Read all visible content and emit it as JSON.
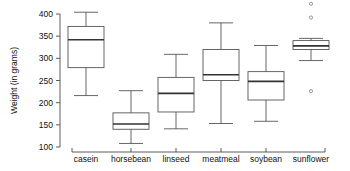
{
  "chart_data": {
    "type": "box",
    "title": "",
    "subtitle": "",
    "xlabel": "",
    "ylabel": "Weight (in grams)",
    "categories": [
      "casein",
      "horsebean",
      "linseed",
      "meatmeal",
      "soybean",
      "sunflower"
    ],
    "ylim": [
      100,
      400
    ],
    "yticks": [
      100,
      150,
      200,
      250,
      300,
      350,
      400
    ],
    "ytick_labels": [
      "100",
      "150",
      "200",
      "250",
      "300",
      "350",
      "400"
    ],
    "grid": false,
    "legend": "none",
    "boxes": [
      {
        "category": "casein",
        "whisker_low": 216,
        "q1": 279,
        "median": 342,
        "q3": 372,
        "whisker_high": 404,
        "outliers": []
      },
      {
        "category": "horsebean",
        "whisker_low": 108,
        "q1": 140,
        "median": 152,
        "q3": 177,
        "whisker_high": 227,
        "outliers": []
      },
      {
        "category": "linseed",
        "whisker_low": 141,
        "q1": 179,
        "median": 221,
        "q3": 257,
        "whisker_high": 309,
        "outliers": []
      },
      {
        "category": "meatmeal",
        "whisker_low": 153,
        "q1": 250,
        "median": 263,
        "q3": 320,
        "whisker_high": 380,
        "outliers": []
      },
      {
        "category": "soybean",
        "whisker_low": 158,
        "q1": 206,
        "median": 248,
        "q3": 270,
        "whisker_high": 329,
        "outliers": []
      },
      {
        "category": "sunflower",
        "whisker_low": 295,
        "q1": 320,
        "median": 328,
        "q3": 340,
        "whisker_high": 345,
        "outliers": [
          226,
          392,
          423
        ]
      }
    ],
    "colors": {
      "box_stroke": "#555555",
      "median_stroke": "#333333",
      "whisker_stroke": "#555555",
      "axis_stroke": "#4a4a4a",
      "outlier_stroke": "#8a8a8a",
      "text": "#111111",
      "background": "#ffffff"
    }
  }
}
